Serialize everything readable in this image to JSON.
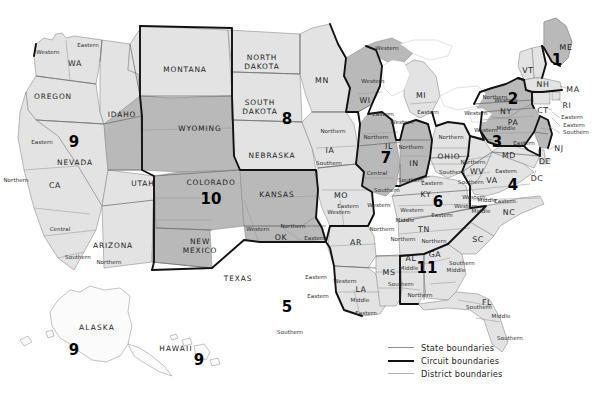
{
  "map": {
    "title": "United States Courts of Appeals and District Courts",
    "colors": {
      "background": "#ffffff",
      "state_fill_light": "#e3e3e3",
      "state_fill_dark": "#b9b9b9",
      "state_boundary": "#8d8d8d",
      "circuit_boundary": "#121212",
      "district_boundary": "#9a9a9a"
    }
  },
  "legend": {
    "items": [
      {
        "label": "State boundaries",
        "style": "state"
      },
      {
        "label": "Circuit boundaries",
        "style": "circuit"
      },
      {
        "label": "District boundaries",
        "style": "district"
      }
    ]
  },
  "circuit_numbers": [
    {
      "num": "1",
      "x": 557,
      "y": 60
    },
    {
      "num": "2",
      "x": 513,
      "y": 99
    },
    {
      "num": "3",
      "x": 497,
      "y": 142
    },
    {
      "num": "4",
      "x": 513,
      "y": 185
    },
    {
      "num": "5",
      "x": 287,
      "y": 307
    },
    {
      "num": "6",
      "x": 438,
      "y": 202
    },
    {
      "num": "7",
      "x": 386,
      "y": 158
    },
    {
      "num": "8",
      "x": 287,
      "y": 119
    },
    {
      "num": "9",
      "x": 74,
      "y": 142
    },
    {
      "num": "9",
      "x": 74,
      "y": 350
    },
    {
      "num": "9",
      "x": 199,
      "y": 360
    },
    {
      "num": "10",
      "x": 211,
      "y": 199
    },
    {
      "num": "11",
      "x": 427,
      "y": 268
    }
  ],
  "state_names": [
    {
      "name": "WA",
      "x": 75,
      "y": 63,
      "kind": "abbr"
    },
    {
      "name": "OREGON",
      "x": 53,
      "y": 96,
      "kind": "name"
    },
    {
      "name": "IDAHO",
      "x": 122,
      "y": 114,
      "kind": "name"
    },
    {
      "name": "MONTANA",
      "x": 185,
      "y": 69,
      "kind": "name"
    },
    {
      "name": "WYOMING",
      "x": 200,
      "y": 128,
      "kind": "name"
    },
    {
      "name": "NORTH\nDAKOTA",
      "x": 262,
      "y": 63,
      "kind": "name"
    },
    {
      "name": "SOUTH\nDAKOTA",
      "x": 260,
      "y": 108,
      "kind": "name"
    },
    {
      "name": "NEBRASKA",
      "x": 272,
      "y": 155,
      "kind": "name"
    },
    {
      "name": "NEVADA",
      "x": 75,
      "y": 162,
      "kind": "name"
    },
    {
      "name": "CA",
      "x": 55,
      "y": 185,
      "kind": "abbr"
    },
    {
      "name": "UTAH",
      "x": 143,
      "y": 183,
      "kind": "name"
    },
    {
      "name": "COLORADO",
      "x": 211,
      "y": 182,
      "kind": "name"
    },
    {
      "name": "KANSAS",
      "x": 277,
      "y": 194,
      "kind": "name"
    },
    {
      "name": "ARIZONA",
      "x": 113,
      "y": 245,
      "kind": "name"
    },
    {
      "name": "NEW\nMEXICO",
      "x": 200,
      "y": 247,
      "kind": "name"
    },
    {
      "name": "TEXAS",
      "x": 238,
      "y": 278,
      "kind": "name"
    },
    {
      "name": "OK",
      "x": 281,
      "y": 237,
      "kind": "abbr"
    },
    {
      "name": "MN",
      "x": 322,
      "y": 80,
      "kind": "abbr"
    },
    {
      "name": "IA",
      "x": 330,
      "y": 150,
      "kind": "abbr"
    },
    {
      "name": "MO",
      "x": 341,
      "y": 195,
      "kind": "abbr"
    },
    {
      "name": "AR",
      "x": 356,
      "y": 242,
      "kind": "abbr"
    },
    {
      "name": "LA",
      "x": 361,
      "y": 289,
      "kind": "abbr"
    },
    {
      "name": "MS",
      "x": 389,
      "y": 272,
      "kind": "abbr"
    },
    {
      "name": "AL",
      "x": 411,
      "y": 258,
      "kind": "abbr"
    },
    {
      "name": "GA",
      "x": 435,
      "y": 254,
      "kind": "abbr"
    },
    {
      "name": "FL",
      "x": 487,
      "y": 302,
      "kind": "abbr"
    },
    {
      "name": "SC",
      "x": 478,
      "y": 239,
      "kind": "abbr"
    },
    {
      "name": "NC",
      "x": 509,
      "y": 212,
      "kind": "abbr"
    },
    {
      "name": "TN",
      "x": 424,
      "y": 229,
      "kind": "abbr"
    },
    {
      "name": "KY",
      "x": 426,
      "y": 194,
      "kind": "abbr"
    },
    {
      "name": "VA",
      "x": 492,
      "y": 180,
      "kind": "abbr"
    },
    {
      "name": "WV",
      "x": 477,
      "y": 171,
      "kind": "abbr"
    },
    {
      "name": "OHIO",
      "x": 449,
      "y": 156,
      "kind": "name"
    },
    {
      "name": "IN",
      "x": 414,
      "y": 163,
      "kind": "abbr"
    },
    {
      "name": "IL",
      "x": 389,
      "y": 146,
      "kind": "abbr"
    },
    {
      "name": "MI",
      "x": 421,
      "y": 95,
      "kind": "abbr"
    },
    {
      "name": "WI",
      "x": 365,
      "y": 100,
      "kind": "abbr"
    },
    {
      "name": "PA",
      "x": 513,
      "y": 122,
      "kind": "abbr"
    },
    {
      "name": "NY",
      "x": 506,
      "y": 111,
      "kind": "abbr"
    },
    {
      "name": "ME",
      "x": 566,
      "y": 47,
      "kind": "abbr"
    },
    {
      "name": "VT",
      "x": 528,
      "y": 70,
      "kind": "abbr"
    },
    {
      "name": "NH",
      "x": 543,
      "y": 84,
      "kind": "abbr"
    },
    {
      "name": "MA",
      "x": 573,
      "y": 89,
      "kind": "abbr"
    },
    {
      "name": "CT",
      "x": 543,
      "y": 110,
      "kind": "abbr"
    },
    {
      "name": "RI",
      "x": 567,
      "y": 105,
      "kind": "abbr"
    },
    {
      "name": "NJ",
      "x": 559,
      "y": 148,
      "kind": "abbr"
    },
    {
      "name": "MD",
      "x": 509,
      "y": 155,
      "kind": "abbr"
    },
    {
      "name": "DE",
      "x": 545,
      "y": 161,
      "kind": "abbr"
    },
    {
      "name": "DC",
      "x": 537,
      "y": 178,
      "kind": "abbr"
    }
  ],
  "district_labels": [
    {
      "name": "Western",
      "x": 48,
      "y": 52
    },
    {
      "name": "Eastern",
      "x": 88,
      "y": 45
    },
    {
      "name": "Eastern",
      "x": 42,
      "y": 142
    },
    {
      "name": "Northern",
      "x": 16,
      "y": 180
    },
    {
      "name": "Central",
      "x": 60,
      "y": 229
    },
    {
      "name": "Southern",
      "x": 78,
      "y": 257
    },
    {
      "name": "Northern",
      "x": 109,
      "y": 262
    },
    {
      "name": "Western",
      "x": 258,
      "y": 229
    },
    {
      "name": "Northern",
      "x": 293,
      "y": 226
    },
    {
      "name": "Eastern",
      "x": 315,
      "y": 238
    },
    {
      "name": "Eastern",
      "x": 316,
      "y": 277
    },
    {
      "name": "Western",
      "x": 345,
      "y": 281
    },
    {
      "name": "Middle",
      "x": 360,
      "y": 300
    },
    {
      "name": "Eastern",
      "x": 366,
      "y": 313
    },
    {
      "name": "Southern",
      "x": 290,
      "y": 332
    },
    {
      "name": "Eastern",
      "x": 318,
      "y": 296
    },
    {
      "name": "Northern",
      "x": 333,
      "y": 131
    },
    {
      "name": "Southern",
      "x": 329,
      "y": 163
    },
    {
      "name": "Eastern",
      "x": 348,
      "y": 206
    },
    {
      "name": "Western",
      "x": 339,
      "y": 212
    },
    {
      "name": "Western",
      "x": 379,
      "y": 205
    },
    {
      "name": "Northern",
      "x": 382,
      "y": 229
    },
    {
      "name": "Northern",
      "x": 403,
      "y": 239
    },
    {
      "name": "Middle",
      "x": 409,
      "y": 268
    },
    {
      "name": "Southern",
      "x": 401,
      "y": 284
    },
    {
      "name": "Northern",
      "x": 420,
      "y": 295
    },
    {
      "name": "Middle",
      "x": 456,
      "y": 270
    },
    {
      "name": "Northern",
      "x": 434,
      "y": 241
    },
    {
      "name": "Southern",
      "x": 462,
      "y": 263
    },
    {
      "name": "Middle",
      "x": 501,
      "y": 316
    },
    {
      "name": "Southern",
      "x": 510,
      "y": 338
    },
    {
      "name": "Western",
      "x": 373,
      "y": 81
    },
    {
      "name": "Eastern",
      "x": 383,
      "y": 114
    },
    {
      "name": "Western",
      "x": 387,
      "y": 48
    },
    {
      "name": "Western",
      "x": 402,
      "y": 122
    },
    {
      "name": "Eastern",
      "x": 428,
      "y": 112
    },
    {
      "name": "Northern",
      "x": 376,
      "y": 137
    },
    {
      "name": "Central",
      "x": 377,
      "y": 173
    },
    {
      "name": "Southern",
      "x": 387,
      "y": 190
    },
    {
      "name": "Northern",
      "x": 411,
      "y": 147
    },
    {
      "name": "Southern",
      "x": 411,
      "y": 180
    },
    {
      "name": "Northern",
      "x": 451,
      "y": 137
    },
    {
      "name": "Southern",
      "x": 452,
      "y": 172
    },
    {
      "name": "Eastern",
      "x": 432,
      "y": 183
    },
    {
      "name": "Western",
      "x": 412,
      "y": 210
    },
    {
      "name": "Middle",
      "x": 405,
      "y": 220
    },
    {
      "name": "Eastern",
      "x": 442,
      "y": 215
    },
    {
      "name": "Northern",
      "x": 473,
      "y": 162
    },
    {
      "name": "Southern",
      "x": 471,
      "y": 182
    },
    {
      "name": "Western",
      "x": 466,
      "y": 206
    },
    {
      "name": "Middle",
      "x": 481,
      "y": 211
    },
    {
      "name": "Eastern",
      "x": 505,
      "y": 201
    },
    {
      "name": "Western",
      "x": 474,
      "y": 197
    },
    {
      "name": "Middle",
      "x": 487,
      "y": 200
    },
    {
      "name": "Eastern",
      "x": 506,
      "y": 171
    },
    {
      "name": "Western",
      "x": 476,
      "y": 113
    },
    {
      "name": "Northern",
      "x": 495,
      "y": 97
    },
    {
      "name": "Western",
      "x": 486,
      "y": 130
    },
    {
      "name": "Middle",
      "x": 506,
      "y": 128
    },
    {
      "name": "Eastern",
      "x": 524,
      "y": 143
    },
    {
      "name": "Eastern",
      "x": 574,
      "y": 125
    },
    {
      "name": "Southern",
      "x": 576,
      "y": 132
    },
    {
      "name": "Eastern",
      "x": 572,
      "y": 117
    },
    {
      "name": "Southern",
      "x": 479,
      "y": 307
    },
    {
      "name": "Western",
      "x": 506,
      "y": 100
    }
  ],
  "insets": [
    {
      "name": "ALASKA",
      "x": 97,
      "y": 327
    },
    {
      "name": "HAWAII",
      "x": 176,
      "y": 348
    }
  ]
}
